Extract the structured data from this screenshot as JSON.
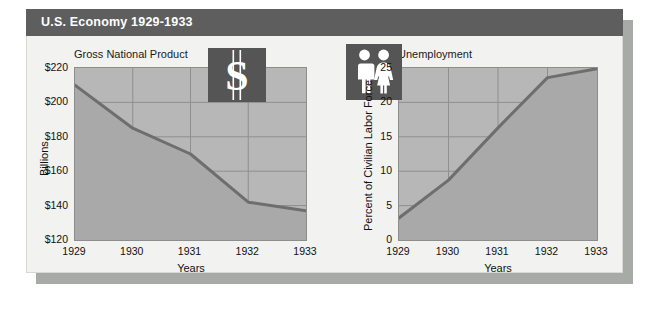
{
  "header": {
    "title": "U.S. Economy 1929-1933"
  },
  "icons": {
    "dollar": "dollar-sign-icon",
    "people": "man-and-woman-pictogram-icon"
  },
  "chart_data": [
    {
      "type": "area",
      "title": "Gross National Product",
      "xlabel": "Years",
      "ylabel": "Billions",
      "categories": [
        "1929",
        "1930",
        "1931",
        "1932",
        "1933"
      ],
      "x": [
        1929,
        1930,
        1931,
        1932,
        1933
      ],
      "values": [
        210,
        185,
        170,
        142,
        137
      ],
      "ytick_labels": [
        "$220",
        "$200",
        "$180",
        "$160",
        "$140",
        "$120"
      ],
      "ytick_values": [
        220,
        200,
        180,
        160,
        140,
        120
      ],
      "ylim": [
        120,
        220
      ],
      "xlim": [
        1929,
        1933
      ],
      "grid": true,
      "legend": "none",
      "series": [
        {
          "name": "Gross National Product",
          "values": [
            210,
            185,
            170,
            142,
            137
          ]
        }
      ],
      "colors": {
        "plot_bg": "#b7b7b7",
        "area_fill": "#a9a9a9",
        "line": "#6e6e6e",
        "grid": "#8f8f8f"
      }
    },
    {
      "type": "area",
      "title": "Unemployment",
      "xlabel": "Years",
      "ylabel": "Percent of Civilian Labor Force",
      "categories": [
        "1929",
        "1930",
        "1931",
        "1932",
        "1933"
      ],
      "x": [
        1929,
        1930,
        1931,
        1932,
        1933
      ],
      "values": [
        3.2,
        8.7,
        16.3,
        23.6,
        24.9
      ],
      "ytick_labels": [
        "25",
        "20",
        "15",
        "10",
        "5",
        "0"
      ],
      "ytick_values": [
        25,
        20,
        15,
        10,
        5,
        0
      ],
      "ylim": [
        0,
        25
      ],
      "xlim": [
        1929,
        1933
      ],
      "grid": true,
      "legend": "none",
      "series": [
        {
          "name": "Unemployment",
          "values": [
            3.2,
            8.7,
            16.3,
            23.6,
            24.9
          ]
        }
      ],
      "colors": {
        "plot_bg": "#b7b7b7",
        "area_fill": "#a9a9a9",
        "line": "#6e6e6e",
        "grid": "#8f8f8f"
      }
    }
  ]
}
